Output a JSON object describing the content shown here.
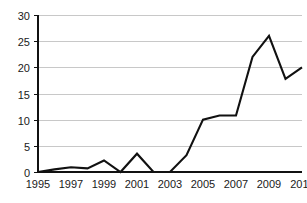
{
  "chart_data": {
    "type": "line",
    "title": "",
    "subtitle": "",
    "xlabel": "",
    "ylabel": "",
    "x": [
      1995,
      1996,
      1997,
      1998,
      1999,
      2000,
      2001,
      2002,
      2003,
      2004,
      2005,
      2006,
      2007,
      2008,
      2009,
      2010,
      2011
    ],
    "values": [
      0,
      0.5,
      0.9,
      0.7,
      2.2,
      0,
      3.5,
      0,
      0,
      3.2,
      10,
      10.8,
      10.8,
      22,
      26,
      17.8,
      20
    ],
    "series": [
      {
        "name": "",
        "values": [
          0,
          0.5,
          0.9,
          0.7,
          2.2,
          0,
          3.5,
          0,
          0,
          3.2,
          10,
          10.8,
          10.8,
          22,
          26,
          17.8,
          20
        ]
      }
    ],
    "xlim": [
      1995,
      2011
    ],
    "ylim": [
      0,
      30
    ],
    "yticks": [
      0,
      5,
      10,
      15,
      20,
      25,
      30
    ],
    "ytick_labels": [
      "0",
      "5",
      "10",
      "15",
      "20",
      "25",
      "30"
    ],
    "xticks": [
      1995,
      1997,
      1999,
      2001,
      2003,
      2005,
      2007,
      2009,
      2011
    ],
    "xtick_labels": [
      "1995",
      "1997",
      "1999",
      "2001",
      "2003",
      "2005",
      "2007",
      "2009",
      "2011"
    ],
    "grid": "horizontal",
    "legend": "none",
    "line_color": "#111111",
    "grid_color": "#c8c8c8",
    "axis_color": "#111111",
    "background_color": "#ffffff"
  }
}
